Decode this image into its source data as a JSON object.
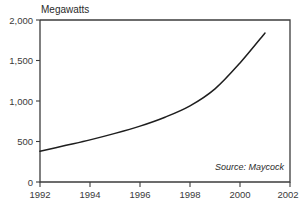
{
  "chart_data": {
    "type": "line",
    "title": "",
    "ylabel": "Megawatts",
    "xlabel": "",
    "xlim": [
      1992,
      2002
    ],
    "ylim": [
      0,
      2000
    ],
    "grid": false,
    "legend": null,
    "x_ticks": [
      "1992",
      "1994",
      "1996",
      "1998",
      "2000",
      "2002"
    ],
    "y_ticks": [
      "0",
      "500",
      "1,000",
      "1,500",
      "2,000"
    ],
    "annotation": "Source: Maycock",
    "series": [
      {
        "name": "Megawatts",
        "x": [
          1992,
          1993,
          1994,
          1995,
          1996,
          1997,
          1998,
          1999,
          2000,
          2001
        ],
        "values": [
          380,
          450,
          520,
          600,
          690,
          800,
          940,
          1150,
          1470,
          1840
        ]
      }
    ]
  },
  "axis": {
    "y_title": "Megawatts",
    "y_tick_labels": [
      "2,000",
      "1,500",
      "1,000",
      "500",
      "0"
    ],
    "x_tick_labels": [
      "1992",
      "1994",
      "1996",
      "1998",
      "2000",
      "2002"
    ]
  },
  "note": {
    "source": "Source: Maycock"
  }
}
